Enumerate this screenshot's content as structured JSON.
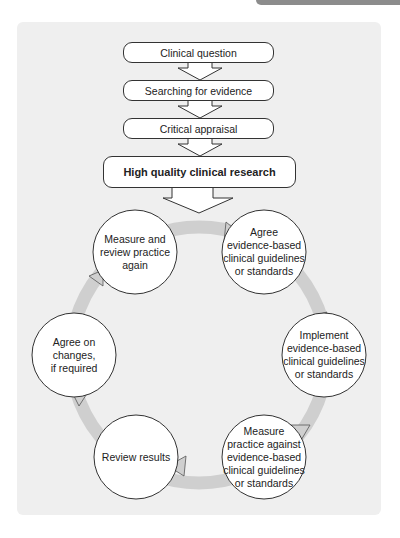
{
  "diagram": {
    "colors": {
      "panel": "#efefef",
      "cycle_arrow": "#cfcfcf",
      "node_fill": "#ffffff",
      "outline": "#333333",
      "top_tab": "#8c8c8c"
    },
    "flow": [
      {
        "id": "clinical-question",
        "label": "Clinical question"
      },
      {
        "id": "searching-for-evidence",
        "label": "Searching for evidence"
      },
      {
        "id": "critical-appraisal",
        "label": "Critical appraisal"
      },
      {
        "id": "high-quality-clinical-research",
        "label": "High quality clinical research",
        "bold": true
      }
    ],
    "cycle": [
      {
        "id": "agree-guidelines",
        "label": "Agree\nevidence-based\nclinical guidelines\nor standards"
      },
      {
        "id": "implement-guidelines",
        "label": "Implement\nevidence-based\nclinical guidelines\nor standards"
      },
      {
        "id": "measure-practice-against",
        "label": "Measure\npractice against\nevidence-based\nclinical guidelines\nor standards"
      },
      {
        "id": "review-results",
        "label": "Review results"
      },
      {
        "id": "agree-on-changes",
        "label": "Agree on changes,\nif required"
      },
      {
        "id": "measure-and-review-again",
        "label": "Measure and\nreview practice\nagain"
      }
    ]
  }
}
